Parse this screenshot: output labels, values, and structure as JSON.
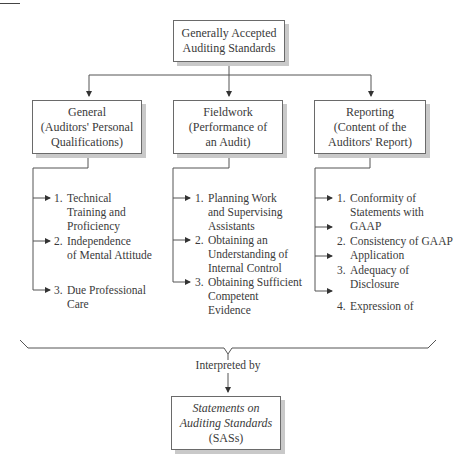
{
  "root": {
    "line1": "Generally Accepted",
    "line2": "Auditing Standards"
  },
  "categories": [
    {
      "title": "General",
      "sub1": "(Auditors' Personal",
      "sub2": "Qualifications)",
      "items": [
        {
          "num": "1.",
          "text": "Technical\nTraining and\nProficiency"
        },
        {
          "num": "2.",
          "text": "Independence\nof Mental Attitude"
        },
        {
          "num": "3.",
          "text": "Due Professional\nCare"
        }
      ]
    },
    {
      "title": "Fieldwork",
      "sub1": "(Performance of",
      "sub2": "an Audit)",
      "items": [
        {
          "num": "1.",
          "text": "Planning Work\nand Supervising\nAssistants"
        },
        {
          "num": "2.",
          "text": "Obtaining an\nUnderstanding of\nInternal Control"
        },
        {
          "num": "3.",
          "text": "Obtaining Sufficient\nCompetent\nEvidence"
        }
      ]
    },
    {
      "title": "Reporting",
      "sub1": "(Content of the",
      "sub2": "Auditors' Report)",
      "items": [
        {
          "num": "1.",
          "text": "Conformity of\nStatements with\nGAAP"
        },
        {
          "num": "2.",
          "text": "Consistency of GAAP\nApplication"
        },
        {
          "num": "3.",
          "text": "Adequacy of\nDisclosure"
        },
        {
          "num": "4.",
          "text": "Expression of"
        }
      ]
    }
  ],
  "connector_label": "Interpreted by",
  "result": {
    "line1": "Statements on",
    "line2": "Auditing Standards",
    "line3": "(SASs)"
  }
}
